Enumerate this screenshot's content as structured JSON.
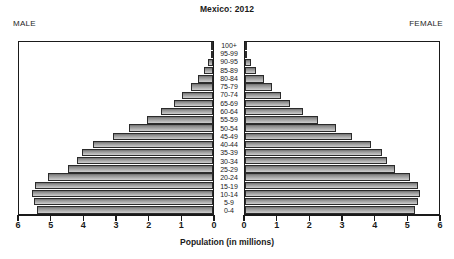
{
  "header": {
    "title": "Mexico: 2012",
    "male_label": "MALE",
    "female_label": "FEMALE"
  },
  "axis": {
    "x_title": "Population (in millions)",
    "left_ticks": [
      "6",
      "5",
      "4",
      "3",
      "2",
      "1",
      "0"
    ],
    "right_ticks": [
      "0",
      "1",
      "2",
      "3",
      "4",
      "5",
      "6"
    ]
  },
  "colors": {
    "bar_fill_top": "#6e6e6e",
    "bar_fill_bottom": "#cfcfcf",
    "bar_border": "#2b2b2b",
    "frame": "#1a1a1a",
    "text": "#1a1a1a",
    "background": "#ffffff"
  },
  "chart_data": {
    "type": "bar",
    "title": "Mexico: 2012",
    "subtitle": "",
    "xlabel": "Population (in millions)",
    "ylabel": "",
    "xlim": [
      0,
      6
    ],
    "grid": false,
    "legend": "none",
    "orientation": "horizontal-mirrored",
    "categories": [
      "0-4",
      "5-9",
      "10-14",
      "15-19",
      "20-24",
      "25-29",
      "30-34",
      "35-39",
      "40-44",
      "45-49",
      "50-54",
      "55-59",
      "60-64",
      "65-69",
      "70-74",
      "75-79",
      "80-84",
      "85-89",
      "90-95",
      "95-99",
      "100+"
    ],
    "series": [
      {
        "name": "MALE",
        "side": "left",
        "values": [
          5.45,
          5.55,
          5.6,
          5.5,
          5.1,
          4.5,
          4.2,
          4.05,
          3.7,
          3.1,
          2.6,
          2.05,
          1.6,
          1.2,
          0.95,
          0.68,
          0.47,
          0.28,
          0.14,
          0.05,
          0.02
        ]
      },
      {
        "name": "FEMALE",
        "side": "right",
        "values": [
          5.25,
          5.35,
          5.4,
          5.35,
          5.1,
          4.65,
          4.4,
          4.25,
          3.9,
          3.3,
          2.8,
          2.25,
          1.8,
          1.4,
          1.1,
          0.82,
          0.58,
          0.35,
          0.18,
          0.07,
          0.03
        ]
      }
    ]
  }
}
